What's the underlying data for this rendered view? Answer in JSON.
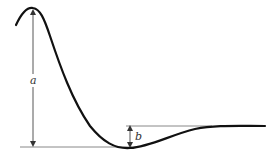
{
  "diagram": {
    "type": "damped-response-curve",
    "labels": {
      "a": "a",
      "b": "b"
    },
    "colors": {
      "curve": "#111111",
      "reference_line": "#888888",
      "dimension_line": "#444444",
      "background": "#ffffff"
    },
    "annotations": [
      {
        "name": "a",
        "description": "vertical distance from peak to baseline minimum"
      },
      {
        "name": "b",
        "description": "vertical distance from minimum undershoot to steady-state level"
      }
    ]
  }
}
